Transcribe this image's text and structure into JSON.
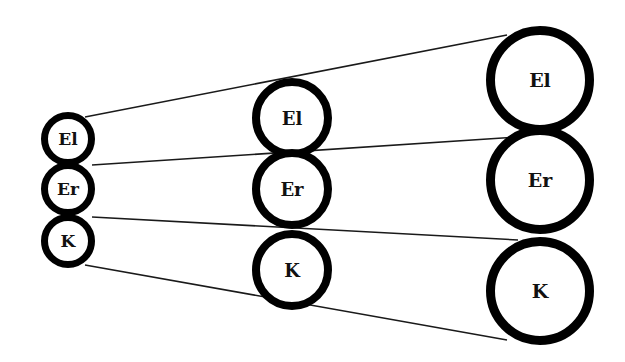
{
  "diagram": {
    "colors": {
      "background": "#ffffff",
      "ring_stroke": "#000000",
      "line": "#1a1a1a",
      "text": "#111111"
    },
    "columns": [
      {
        "name": "small",
        "cx": 68,
        "r": 23.5,
        "stroke": 7,
        "font_size": 17,
        "nodes": [
          {
            "label": "El",
            "cy": 139
          },
          {
            "label": "Er",
            "cy": 189
          },
          {
            "label": "K",
            "cy": 241
          }
        ]
      },
      {
        "name": "medium",
        "cx": 292,
        "r": 36,
        "stroke": 8,
        "font_size": 18,
        "nodes": [
          {
            "label": "El",
            "cy": 118
          },
          {
            "label": "Er",
            "cy": 189
          },
          {
            "label": "K",
            "cy": 270
          }
        ]
      },
      {
        "name": "large",
        "cx": 540,
        "r": 49.5,
        "stroke": 9,
        "font_size": 19,
        "nodes": [
          {
            "label": "El",
            "cy": 80
          },
          {
            "label": "Er",
            "cy": 180
          },
          {
            "label": "K",
            "cy": 291
          }
        ]
      }
    ],
    "lines": [
      {
        "name": "top-line",
        "x1": 85,
        "y1": 117,
        "x2": 507,
        "y2": 35
      },
      {
        "name": "el-er-line",
        "x1": 92,
        "y1": 165,
        "x2": 518,
        "y2": 137
      },
      {
        "name": "er-k-line",
        "x1": 92,
        "y1": 217,
        "x2": 518,
        "y2": 240
      },
      {
        "name": "bottom-line",
        "x1": 85,
        "y1": 265,
        "x2": 507,
        "y2": 340
      }
    ]
  }
}
